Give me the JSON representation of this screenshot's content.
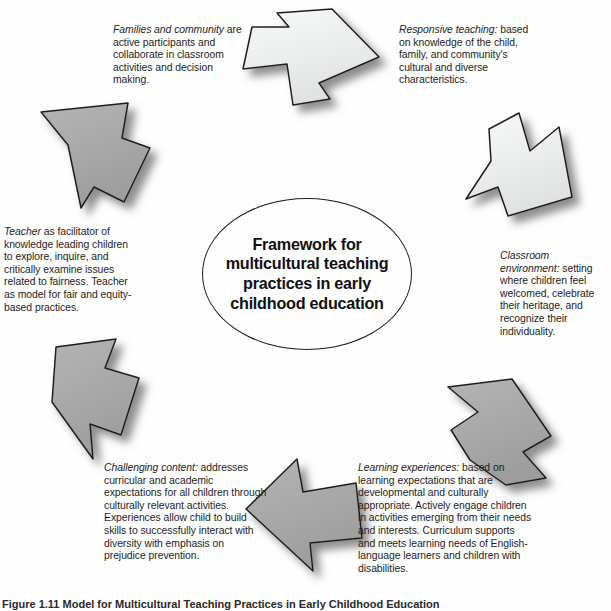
{
  "figure": {
    "center_title": "Framework for multicultural teaching practices in early childhood education",
    "caption": "Figure 1.11   Model for Multicultural Teaching Practices in Early Childhood Education",
    "outline_color": "#1a1a1a",
    "arrow_fill_light": "#eef0ef",
    "arrow_fill_dark": "#a8a8a8",
    "text_color": "#1d1d1d",
    "background": "#ffffff"
  },
  "blocks": [
    {
      "id": "families",
      "lead": "Families and community",
      "body": " are active participants and collaborate in classroom activities and decision making."
    },
    {
      "id": "responsive",
      "lead": "Responsive teaching:",
      "body": " based on knowledge of the child, family, and community's cultural and diverse characteristics."
    },
    {
      "id": "classroom",
      "lead": "Classroom environment:",
      "body": " setting where children feel welcomed, celebrate their heritage, and recognize their individuality."
    },
    {
      "id": "learning",
      "lead": "Learning experiences:",
      "body": " based on learning expectations that are developmental and culturally appropriate. Actively engage children in activities emerging from their needs and interests. Curriculum supports and meets learning needs of English-language learners and children with disabilities."
    },
    {
      "id": "challenging",
      "lead": "Challenging content:",
      "body": " addresses curricular and academic expectations for all children through culturally relevant activities. Experiences allow child to build skills to successfully interact with diversity with emphasis on prejudice prevention."
    },
    {
      "id": "teacher",
      "lead": "Teacher",
      "body": " as facilitator of knowledge leading children to explore, inquire, and critically examine issues related to fairness. Teacher as model for fair and equity-based practices."
    }
  ],
  "arrows": [
    {
      "id": "top",
      "direction": "right",
      "tone": "light"
    },
    {
      "id": "upper-right",
      "direction": "down-right",
      "tone": "light"
    },
    {
      "id": "lower-right",
      "direction": "down-left",
      "tone": "dark"
    },
    {
      "id": "bottom",
      "direction": "left",
      "tone": "dark"
    },
    {
      "id": "lower-left",
      "direction": "up-left",
      "tone": "dark"
    },
    {
      "id": "upper-left",
      "direction": "up-right",
      "tone": "dark"
    }
  ]
}
